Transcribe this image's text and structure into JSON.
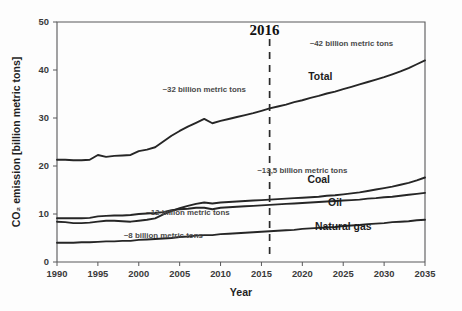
{
  "chart_data": {
    "type": "line",
    "title": "",
    "xlabel": "Year",
    "ylabel": "CO2 emission [billion metric tons]",
    "ylabel_display": "CO₂ emission [billion metric tons]",
    "xlim": [
      1990,
      2035
    ],
    "ylim": [
      0,
      50
    ],
    "xticks": [
      1990,
      1995,
      2000,
      2005,
      2010,
      2015,
      2020,
      2025,
      2030,
      2035
    ],
    "yticks": [
      0,
      10,
      20,
      30,
      40,
      50
    ],
    "grid": false,
    "legend_position": "inline-series-labels",
    "x": [
      1990,
      1991,
      1992,
      1993,
      1994,
      1995,
      1996,
      1997,
      1998,
      1999,
      2000,
      2001,
      2002,
      2003,
      2004,
      2005,
      2006,
      2007,
      2008,
      2009,
      2010,
      2011,
      2012,
      2013,
      2014,
      2015,
      2016,
      2017,
      2018,
      2019,
      2020,
      2021,
      2022,
      2023,
      2024,
      2025,
      2026,
      2027,
      2028,
      2029,
      2030,
      2031,
      2032,
      2033,
      2034,
      2035
    ],
    "series": [
      {
        "name": "Total",
        "label": "Total",
        "values": [
          21.3,
          21.3,
          21.2,
          21.2,
          21.3,
          22.3,
          21.9,
          22.1,
          22.2,
          22.3,
          23.1,
          23.4,
          23.9,
          25.1,
          26.3,
          27.3,
          28.2,
          29.0,
          29.8,
          28.9,
          29.4,
          29.8,
          30.2,
          30.6,
          31.0,
          31.5,
          32.0,
          32.4,
          32.8,
          33.3,
          33.7,
          34.2,
          34.6,
          35.1,
          35.5,
          36.0,
          36.5,
          37.0,
          37.5,
          38.0,
          38.5,
          39.1,
          39.7,
          40.4,
          41.2,
          42.0
        ],
        "annotation_start": "~32 billion metric tons",
        "annotation_end": "~42 billion metric tons"
      },
      {
        "name": "Coal",
        "label": "Coal",
        "values": [
          8.4,
          8.3,
          8.1,
          8.1,
          8.2,
          8.4,
          8.6,
          8.6,
          8.5,
          8.4,
          8.6,
          8.8,
          9.1,
          9.9,
          10.6,
          11.2,
          11.7,
          12.1,
          12.4,
          12.2,
          12.4,
          12.5,
          12.6,
          12.7,
          12.8,
          12.9,
          13.0,
          13.1,
          13.2,
          13.3,
          13.4,
          13.5,
          13.6,
          13.8,
          13.9,
          14.1,
          14.3,
          14.5,
          14.8,
          15.1,
          15.4,
          15.7,
          16.1,
          16.5,
          17.0,
          17.6
        ],
        "annotation_2016": "~13,5 billion metric tons"
      },
      {
        "name": "Oil",
        "label": "Oil",
        "values": [
          9.1,
          9.1,
          9.1,
          9.1,
          9.2,
          9.5,
          9.6,
          9.7,
          9.7,
          9.8,
          10.0,
          10.1,
          10.2,
          10.4,
          10.8,
          11.0,
          11.1,
          11.3,
          11.3,
          11.0,
          11.3,
          11.4,
          11.5,
          11.6,
          11.7,
          11.8,
          11.9,
          12.0,
          12.1,
          12.2,
          12.3,
          12.4,
          12.5,
          12.6,
          12.7,
          12.8,
          12.9,
          13.0,
          13.2,
          13.3,
          13.5,
          13.6,
          13.8,
          14.0,
          14.2,
          14.4
        ],
        "annotation_2016": "~12 billion metric tons"
      },
      {
        "name": "Natural gas",
        "label": "Natural gas",
        "values": [
          4.0,
          4.0,
          4.0,
          4.1,
          4.1,
          4.2,
          4.3,
          4.3,
          4.4,
          4.4,
          4.6,
          4.7,
          4.8,
          4.9,
          5.0,
          5.2,
          5.3,
          5.5,
          5.6,
          5.6,
          5.8,
          5.9,
          6.0,
          6.1,
          6.2,
          6.3,
          6.4,
          6.5,
          6.6,
          6.7,
          6.9,
          7.0,
          7.1,
          7.2,
          7.3,
          7.5,
          7.6,
          7.7,
          7.9,
          8.0,
          8.1,
          8.3,
          8.4,
          8.5,
          8.7,
          8.8
        ],
        "annotation_2016": "~8 billion metric tons"
      }
    ],
    "annotations": [
      {
        "id": "total-historical",
        "text": "~32 billion metric tons",
        "x": 2008,
        "y": 35.5
      },
      {
        "id": "total-projected",
        "text": "~42 billion metric tons",
        "x": 2026,
        "y": 45.0
      },
      {
        "id": "coal-2016",
        "text": "~13,5 billion metric tons",
        "x": 2020,
        "y": 18.5
      },
      {
        "id": "oil-2016",
        "text": "~12 billion metric tons",
        "x": 2006,
        "y": 9.8
      },
      {
        "id": "gas-2016",
        "text": "~8 billion metric tons",
        "x": 2003,
        "y": 4.9
      }
    ],
    "marker_line": {
      "label": "2016",
      "x": 2016,
      "style": "dashed"
    }
  },
  "axes": {
    "x_title": "Year",
    "y_title": "CO₂ emission [billion metric tons]",
    "x_tick_labels": [
      "1990",
      "1995",
      "2000",
      "2005",
      "2010",
      "2015",
      "2020",
      "2025",
      "2030",
      "2035"
    ],
    "y_tick_labels": [
      "0",
      "10",
      "20",
      "30",
      "40",
      "50"
    ]
  },
  "colors": {
    "line": "#262626",
    "axis": "#58585a",
    "annotation_text": "#4a4a4a",
    "label_text": "#1c1c1c",
    "background": "#fdfdfd"
  }
}
